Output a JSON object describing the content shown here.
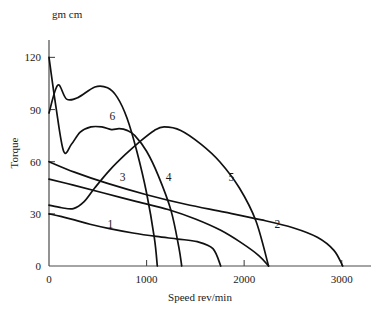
{
  "chart_data": {
    "type": "line",
    "title": "",
    "subtitle": "",
    "xlabel": "Speed rev/min",
    "ylabel": "Torque",
    "yunit": "gm cm",
    "xlim": [
      0,
      3300
    ],
    "ylim": [
      0,
      130
    ],
    "xticks": [
      0,
      1000,
      2000,
      3000
    ],
    "xticklabels": [
      "0",
      "1000",
      "2000",
      "3000"
    ],
    "yticks": [
      0,
      30,
      60,
      90,
      120
    ],
    "yticklabels": [
      "0",
      "30",
      "60",
      "90",
      "120"
    ],
    "grid": false,
    "legend": "inline-curve-labels",
    "annotations": [
      {
        "text": "1",
        "x": 630,
        "y": 22
      },
      {
        "text": "2",
        "x": 2340,
        "y": 22
      },
      {
        "text": "3",
        "x": 755,
        "y": 49
      },
      {
        "text": "4",
        "x": 1225,
        "y": 49
      },
      {
        "text": "5",
        "x": 1870,
        "y": 49
      },
      {
        "text": "6",
        "x": 650,
        "y": 84
      }
    ],
    "series": [
      {
        "name": "1",
        "x": [
          0,
          120,
          260,
          420,
          620,
          860,
          1100,
          1320,
          1520,
          1680,
          1760
        ],
        "y": [
          30,
          28.5,
          26.5,
          24,
          21.5,
          19,
          17,
          15.5,
          14,
          10,
          0
        ]
      },
      {
        "name": "2",
        "x": [
          0,
          260,
          600,
          1000,
          1400,
          1800,
          2180,
          2500,
          2750,
          2920,
          3010
        ],
        "y": [
          60,
          54,
          47.5,
          41,
          35.5,
          31,
          26.5,
          22,
          16.5,
          9,
          0
        ]
      },
      {
        "name": "3",
        "x": [
          0,
          250,
          560,
          900,
          1220,
          1500,
          1760,
          1980,
          2150,
          2250
        ],
        "y": [
          50,
          46.5,
          42,
          37,
          32.5,
          27,
          20.5,
          13,
          6,
          0
        ]
      },
      {
        "name": "4",
        "x": [
          0,
          90,
          180,
          300,
          470,
          600,
          700,
          800,
          900,
          1000,
          1080,
          1110
        ],
        "y": [
          88,
          104,
          96,
          97,
          103,
          102.5,
          97,
          85,
          66,
          42,
          16,
          0
        ]
      },
      {
        "name": "5",
        "x": [
          0,
          130,
          250,
          360,
          470,
          620,
          780,
          940,
          1080,
          1180,
          1350,
          1560,
          1750,
          1950,
          2120,
          2250
        ],
        "y": [
          35,
          33.5,
          33,
          37,
          45,
          55,
          64,
          72,
          78,
          80,
          78,
          70,
          60,
          45,
          26,
          0
        ]
      },
      {
        "name": "6",
        "x": [
          0,
          70,
          150,
          230,
          320,
          430,
          540,
          640,
          720,
          800,
          880,
          1000,
          1120,
          1250,
          1330,
          1360
        ],
        "y": [
          120,
          92,
          66,
          70,
          77,
          80,
          80,
          78.5,
          79,
          78,
          75,
          66,
          52,
          32,
          11,
          0
        ]
      }
    ]
  },
  "axis": {
    "yunit_text": "gm cm",
    "ylabel_text": "Torque",
    "xlabel_text": "Speed rev/min"
  }
}
